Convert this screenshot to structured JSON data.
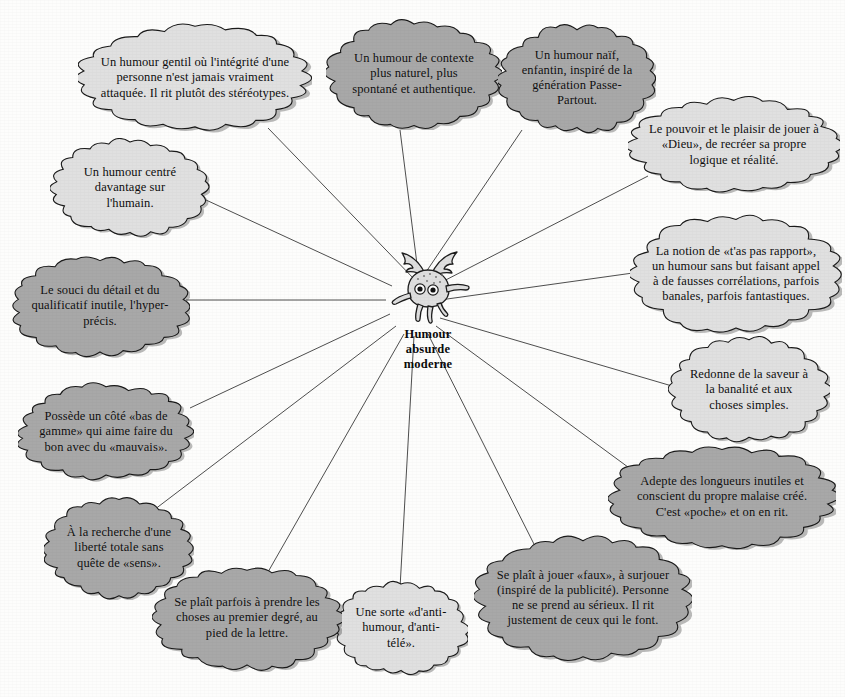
{
  "diagram": {
    "type": "radial-mind-map",
    "center": {
      "label": "Humour\nabsurde\nmoderne",
      "label_lines": [
        "Humour",
        "absurde",
        "moderne"
      ],
      "icon": "winged-octopus-icon"
    },
    "colors": {
      "cloud_light": "#e0e0e0",
      "cloud_mid": "#a8a8a8",
      "outline": "#1a1a1a",
      "background": "#fdfdfc",
      "text": "#0d0d0d"
    },
    "nodes": [
      {
        "id": "gentil",
        "text": "Un humour gentil où l'intégrité d'une personne n'est jamais vraiment attaquée. Il rit plutôt des stéréotypes.",
        "shade": "light",
        "x": 78,
        "y": 22,
        "w": 234,
        "h": 112,
        "font": 12.5
      },
      {
        "id": "contexte",
        "text": "Un humour de contexte plus naturel, plus spontané et authentique.",
        "shade": "mid",
        "x": 326,
        "y": 18,
        "w": 176,
        "h": 112,
        "font": 12.5
      },
      {
        "id": "naif",
        "text": "Un humour naïf, enfantin, inspiré de la génération Passe-Partout.",
        "shade": "mid",
        "x": 498,
        "y": 22,
        "w": 158,
        "h": 112,
        "font": 12.5
      },
      {
        "id": "dieu",
        "text": "Le pouvoir et le plaisir de jouer à «Dieu», de recréer sa propre logique et réalité.",
        "shade": "light",
        "x": 628,
        "y": 96,
        "w": 212,
        "h": 98,
        "font": 12.5
      },
      {
        "id": "rapport",
        "text": "La notion de «t'as pas rapport», un humour sans but faisant appel à de fausses corrélations, parfois banales, parfois fantastiques.",
        "shade": "light",
        "x": 630,
        "y": 212,
        "w": 212,
        "h": 124,
        "font": 12.5
      },
      {
        "id": "banalite",
        "text": "Redonne de la saveur à la banalité et aux choses simples.",
        "shade": "light",
        "x": 668,
        "y": 336,
        "w": 162,
        "h": 108,
        "font": 12.5
      },
      {
        "id": "longueurs",
        "text": "Adepte des longueurs inutiles et conscient du propre malaise créé. C'est «poche» et on en rit.",
        "shade": "mid",
        "x": 608,
        "y": 444,
        "w": 228,
        "h": 106,
        "font": 12.5
      },
      {
        "id": "faux",
        "text": "Se plaît à jouer «faux», à surjouer (inspiré de la publicité). Personne ne se prend au sérieux. Il rit justement de ceux qui le font.",
        "shade": "mid",
        "x": 474,
        "y": 532,
        "w": 218,
        "h": 132,
        "font": 12.5
      },
      {
        "id": "antihumour",
        "text": "Une sorte «d'anti-humour, d'anti-télé».",
        "shade": "light",
        "x": 334,
        "y": 580,
        "w": 134,
        "h": 96,
        "font": 12.5
      },
      {
        "id": "premierdegre",
        "text": "Se plaît parfois à prendre les choses au premier degré, au pied de la lettre.",
        "shade": "mid",
        "x": 152,
        "y": 564,
        "w": 190,
        "h": 108,
        "font": 12.5
      },
      {
        "id": "liberte",
        "text": "À la recherche d'une liberté totale sans quête de «sens».",
        "shade": "mid",
        "x": 44,
        "y": 496,
        "w": 150,
        "h": 104,
        "font": 12.5
      },
      {
        "id": "basdegamme",
        "text": "Possède un côté «bas de gamme» qui aime faire du bon avec du «mauvais».",
        "shade": "mid",
        "x": 18,
        "y": 382,
        "w": 176,
        "h": 100,
        "font": 12.5
      },
      {
        "id": "detail",
        "text": "Le souci du détail et du qualificatif inutile, l'hyper-précis.",
        "shade": "mid",
        "x": 10,
        "y": 254,
        "w": 180,
        "h": 104,
        "font": 12.5
      },
      {
        "id": "humain",
        "text": "Un humour centré davantage sur l'humain.",
        "shade": "light",
        "x": 50,
        "y": 138,
        "w": 160,
        "h": 100,
        "font": 12.5
      }
    ],
    "connectors": [
      {
        "from": "center",
        "to": "gentil",
        "x1": 415,
        "y1": 280,
        "x2": 268,
        "y2": 128
      },
      {
        "from": "center",
        "to": "contexte",
        "x1": 418,
        "y1": 272,
        "x2": 400,
        "y2": 130
      },
      {
        "from": "center",
        "to": "naif",
        "x1": 426,
        "y1": 272,
        "x2": 522,
        "y2": 130
      },
      {
        "from": "center",
        "to": "dieu",
        "x1": 434,
        "y1": 286,
        "x2": 648,
        "y2": 176
      },
      {
        "from": "center",
        "to": "rapport",
        "x1": 440,
        "y1": 300,
        "x2": 640,
        "y2": 272
      },
      {
        "from": "center",
        "to": "banalite",
        "x1": 440,
        "y1": 318,
        "x2": 672,
        "y2": 386
      },
      {
        "from": "center",
        "to": "longueurs",
        "x1": 436,
        "y1": 326,
        "x2": 632,
        "y2": 470
      },
      {
        "from": "center",
        "to": "faux",
        "x1": 428,
        "y1": 334,
        "x2": 540,
        "y2": 556
      },
      {
        "from": "center",
        "to": "antihumour",
        "x1": 414,
        "y1": 336,
        "x2": 400,
        "y2": 588
      },
      {
        "from": "center",
        "to": "premierdegre",
        "x1": 404,
        "y1": 334,
        "x2": 268,
        "y2": 572
      },
      {
        "from": "center",
        "to": "liberte",
        "x1": 396,
        "y1": 326,
        "x2": 146,
        "y2": 516
      },
      {
        "from": "center",
        "to": "basdegamme",
        "x1": 390,
        "y1": 314,
        "x2": 190,
        "y2": 408
      },
      {
        "from": "center",
        "to": "detail",
        "x1": 386,
        "y1": 300,
        "x2": 186,
        "y2": 300
      },
      {
        "from": "center",
        "to": "humain",
        "x1": 392,
        "y1": 286,
        "x2": 206,
        "y2": 200
      }
    ]
  }
}
